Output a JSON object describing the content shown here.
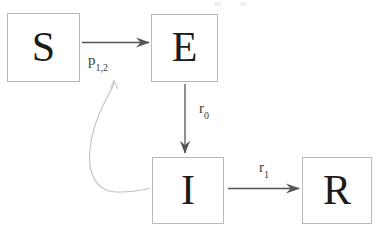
{
  "diagram": {
    "type": "flow-diagram",
    "background_color": "#ffffff",
    "box_border_color": "#b9b9b9",
    "box_fill_color": "#ffffff",
    "letter_color": "#1b1b1b",
    "arrow_color": "#555555",
    "curve_color": "#bdbdbd",
    "nodes": [
      {
        "id": "S",
        "label": "S",
        "x": 7,
        "y": 13,
        "width": 73,
        "height": 69,
        "name": "susceptible-compartment"
      },
      {
        "id": "E",
        "label": "E",
        "x": 151,
        "y": 14,
        "width": 67,
        "height": 68,
        "name": "exposed-compartment"
      },
      {
        "id": "I",
        "label": "I",
        "x": 152,
        "y": 157,
        "width": 72,
        "height": 67,
        "name": "infectious-compartment"
      },
      {
        "id": "R",
        "label": "R",
        "x": 302,
        "y": 157,
        "width": 70,
        "height": 67,
        "name": "recovered-compartment"
      }
    ],
    "edges": [
      {
        "id": "s-to-e",
        "from": "S",
        "to": "E",
        "label_base": "p",
        "label_sub": "1,2",
        "label_x": 88,
        "label_y": 51,
        "style": "straight-arrow"
      },
      {
        "id": "e-to-i",
        "from": "E",
        "to": "I",
        "label_base": "r",
        "label_sub": "0",
        "label_x": 199,
        "label_y": 99,
        "style": "straight-arrow"
      },
      {
        "id": "i-to-r",
        "from": "I",
        "to": "R",
        "label_base": "r",
        "label_sub": "1",
        "label_x": 259,
        "label_y": 158,
        "style": "straight-arrow"
      },
      {
        "id": "i-to-infection-feedback",
        "from": "I",
        "to": "s-to-e",
        "label_base": "",
        "label_sub": "",
        "style": "curved-arrow"
      }
    ]
  }
}
